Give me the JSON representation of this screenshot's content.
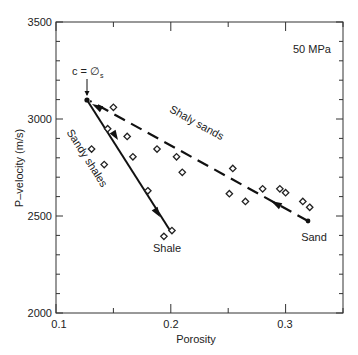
{
  "chart_data": {
    "type": "scatter",
    "title": "",
    "annotation_pressure": "50 MPa",
    "xlabel": "Porosity",
    "ylabel": "P–velocity (m/s)",
    "xlim": [
      0.1,
      0.35
    ],
    "ylim": [
      2000,
      3500
    ],
    "xticks": [
      0.1,
      0.2,
      0.3
    ],
    "xtick_labels": [
      "0.1",
      "0.2",
      "0.3"
    ],
    "yticks": [
      2000,
      2500,
      3000,
      3500
    ],
    "ytick_labels": [
      "2000",
      "2500",
      "3000",
      "3500"
    ],
    "grid": false,
    "series": [
      {
        "name": "Measured samples",
        "marker": "open-diamond",
        "points": [
          [
            0.15,
            3060
          ],
          [
            0.145,
            2950
          ],
          [
            0.162,
            2910
          ],
          [
            0.131,
            2845
          ],
          [
            0.188,
            2845
          ],
          [
            0.167,
            2805
          ],
          [
            0.205,
            2805
          ],
          [
            0.142,
            2765
          ],
          [
            0.21,
            2725
          ],
          [
            0.18,
            2630
          ],
          [
            0.254,
            2745
          ],
          [
            0.251,
            2615
          ],
          [
            0.265,
            2575
          ],
          [
            0.28,
            2640
          ],
          [
            0.295,
            2640
          ],
          [
            0.3,
            2620
          ],
          [
            0.315,
            2575
          ],
          [
            0.321,
            2545
          ],
          [
            0.194,
            2395
          ],
          [
            0.201,
            2425
          ]
        ]
      },
      {
        "name": "Sandy shales",
        "style": "solid-line",
        "points": [
          [
            0.127,
            3100
          ],
          [
            0.2,
            2420
          ]
        ]
      },
      {
        "name": "Shaly sands",
        "style": "dashed-line",
        "points": [
          [
            0.32,
            2475
          ],
          [
            0.127,
            3100
          ]
        ]
      }
    ],
    "annotations": [
      {
        "text": "c = ∅",
        "subscript": "s",
        "at": [
          0.127,
          3100
        ]
      },
      {
        "text": "Shaly sands"
      },
      {
        "text": "Sandy shales"
      },
      {
        "text": "Shale",
        "at": [
          0.2,
          2420
        ]
      },
      {
        "text": "Sand",
        "at": [
          0.32,
          2475
        ]
      }
    ]
  },
  "labels": {
    "pressure": "50 MPa",
    "xlabel": "Porosity",
    "ylabel": "P–velocity (m/s)",
    "c_label": "c = ∅",
    "c_sub": "s",
    "shaly_sands": "Shaly sands",
    "sandy_shales": "Sandy shales",
    "shale": "Shale",
    "sand": "Sand",
    "yt0": "2000",
    "yt1": "2500",
    "yt2": "3000",
    "yt3": "3500",
    "xt0": "0.1",
    "xt1": "0.2",
    "xt2": "0.3"
  }
}
